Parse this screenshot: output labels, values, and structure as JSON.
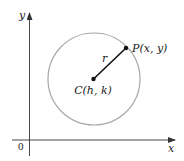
{
  "diagram": {
    "type": "circle-on-coordinate-plane",
    "axes": {
      "x_label": "x",
      "y_label": "y",
      "origin_label": "0"
    },
    "circle": {
      "center_label": "C(h, k)",
      "point_label": "P(x, y)",
      "radius_label": "r"
    },
    "colors": {
      "axis": "#333333",
      "circle": "#a8a8a8",
      "radius": "#111111",
      "text": "#222222",
      "background": "#ffffff"
    }
  }
}
